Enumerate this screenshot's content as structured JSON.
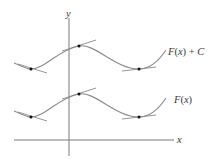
{
  "figure": {
    "axis_labels": {
      "x": "x",
      "y": "y"
    },
    "curves": [
      {
        "name": "F(x) + C",
        "label_parts": [
          "F",
          "(",
          "x",
          ") + ",
          "C"
        ]
      },
      {
        "name": "F(x)",
        "label_parts": [
          "F",
          "(",
          "x",
          ")"
        ]
      }
    ],
    "colors": {
      "curve": "#8a8a8a",
      "axis": "#7a7a7a",
      "tangent": "#8a8a8a",
      "point": "#111111",
      "text": "#3a3a3a"
    }
  }
}
